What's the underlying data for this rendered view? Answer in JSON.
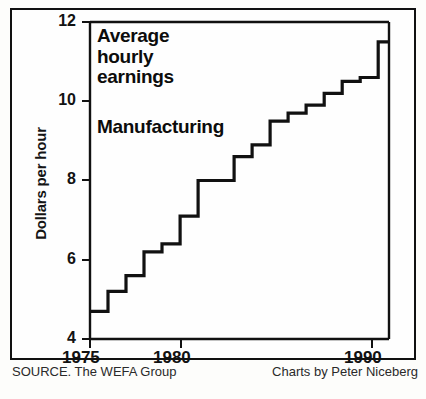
{
  "figure": {
    "headline_lines": [
      "Average",
      "hourly",
      "earnings"
    ],
    "subhead": "Manufacturing",
    "source_note": "SOURCE. The WEFA Group",
    "credit_note": "Charts by Peter Niceberg",
    "frame_color": "#111111",
    "ink_color": "#111111",
    "paper_color": "#fdfdfb"
  },
  "chart_data": {
    "type": "line",
    "subtype": "step",
    "title": "Average hourly earnings",
    "subtitle": "Manufacturing",
    "xlabel": "",
    "ylabel": "Dollars per hour",
    "xlim": [
      1975,
      1991.6
    ],
    "ylim": [
      4,
      12
    ],
    "grid": false,
    "legend": "none",
    "source": "The WEFA Group",
    "credit": "Charts by Peter Niceberg",
    "x_ticks": [
      1975,
      1980,
      1990
    ],
    "x_tick_labels": [
      "1975",
      "1980",
      "1990"
    ],
    "y_ticks": [
      4,
      6,
      8,
      10,
      12
    ],
    "y_tick_labels": [
      "4",
      "6",
      "8",
      "10",
      "12"
    ],
    "x": [
      1975,
      1976,
      1977,
      1978,
      1979,
      1980,
      1981,
      1982,
      1983,
      1984,
      1985,
      1986,
      1987,
      1988,
      1989,
      1990,
      1991
    ],
    "values": [
      4.7,
      5.2,
      5.6,
      6.2,
      6.4,
      7.1,
      8.0,
      8.0,
      8.6,
      8.9,
      9.5,
      9.7,
      9.9,
      10.2,
      10.5,
      10.6,
      11.5
    ],
    "units": "USD per hour",
    "series": [
      {
        "name": "Average hourly earnings, Manufacturing",
        "values": [
          4.7,
          5.2,
          5.6,
          6.2,
          6.4,
          7.1,
          8.0,
          8.0,
          8.6,
          8.9,
          9.5,
          9.7,
          9.9,
          10.2,
          10.5,
          10.6,
          11.5
        ]
      }
    ]
  }
}
